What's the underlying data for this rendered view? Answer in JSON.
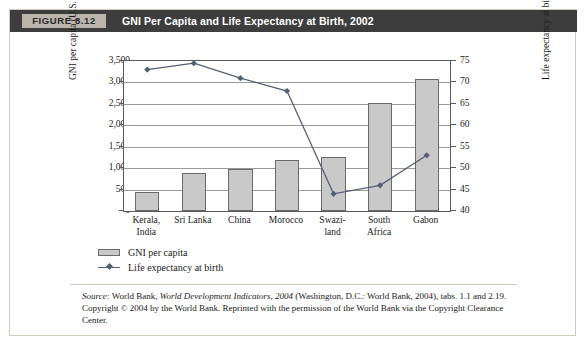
{
  "figure": {
    "label": "FIGURE 8.12",
    "title": "GNI Per Capita and Life Expectancy at Birth, 2002"
  },
  "chart_data": {
    "type": "bar",
    "title": "GNI Per Capita and Life Expectancy at Birth, 2002",
    "categories": [
      "Kerala, India",
      "Sri Lanka",
      "China",
      "Morocco",
      "Swaziland",
      "South Africa",
      "Gabon"
    ],
    "category_lines": [
      [
        "Kerala,",
        "India"
      ],
      [
        "Sri Lanka",
        ""
      ],
      [
        "China",
        ""
      ],
      [
        "Morocco",
        ""
      ],
      [
        "Swazi-",
        "land"
      ],
      [
        "South",
        "Africa"
      ],
      [
        "Gabon",
        ""
      ]
    ],
    "series": [
      {
        "name": "GNI per capita",
        "type": "bar",
        "axis": "left",
        "values": [
          450,
          880,
          990,
          1190,
          1260,
          2520,
          3070
        ]
      },
      {
        "name": "Life expectancy at birth",
        "type": "line",
        "axis": "right",
        "values": [
          73,
          74.5,
          71,
          68,
          44,
          46,
          53
        ]
      }
    ],
    "xlabel": "",
    "ylabel": "GNI per capita (U.S. dollars), 2002",
    "ylabel_right": "Life expectancy at birth (years), 2002",
    "ylim": [
      0,
      3500
    ],
    "ylim_right": [
      40,
      75
    ],
    "yticks": [
      "0",
      "500",
      "1,000",
      "1,500",
      "2,000",
      "2,500",
      "3,000",
      "3,500"
    ],
    "ytick_values": [
      0,
      500,
      1000,
      1500,
      2000,
      2500,
      3000,
      3500
    ],
    "yticks_right": [
      "40",
      "45",
      "50",
      "55",
      "60",
      "65",
      "70",
      "75"
    ],
    "ytick_values_right": [
      40,
      45,
      50,
      55,
      60,
      65,
      70,
      75
    ],
    "grid": true,
    "legend_position": "below-left",
    "legend": [
      "GNI per capita",
      "Life expectancy at birth"
    ],
    "bar_color": "#c9c9c9",
    "line_color": "#555f72"
  },
  "source": {
    "prefix": "Source:",
    "line1_a": " World Bank, ",
    "line1_italic": "World Development Indicators, 2004",
    "line1_b": " (Washington, D.C.: World Bank, 2004), tabs. 1.1 and 2.19.",
    "line2": "Copyright © 2004 by the World Bank. Reprinted with the permission of the World Bank via the Copyright Clearance Center."
  }
}
